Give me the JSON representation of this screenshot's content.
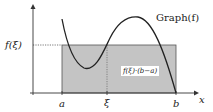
{
  "diagram": {
    "labels": {
      "graph": "Graph(f)",
      "f_xi": "f(ξ)",
      "a": "a",
      "xi": "ξ",
      "b": "b",
      "x_axis": "x",
      "area": "f(ξ)·(b−a)"
    },
    "colors": {
      "rect_fill": "#c4c4c4",
      "curve": "#222222",
      "axis": "#333333"
    }
  }
}
